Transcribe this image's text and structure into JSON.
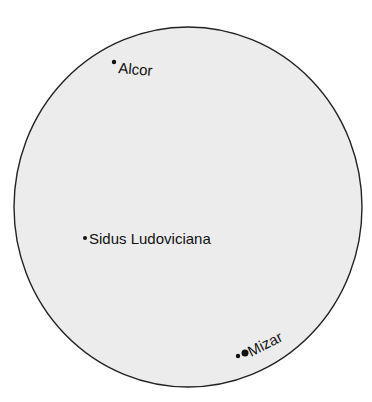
{
  "diagram": {
    "type": "telescope-field-of-view",
    "field": {
      "cx": 188,
      "cy": 207,
      "rx": 174,
      "ry": 180,
      "fill": "#ececec",
      "stroke": "#222222"
    },
    "stars": [
      {
        "name": "Alcor",
        "label": "Alcor",
        "dot": {
          "x": 114,
          "y": 62,
          "r": 2.2
        },
        "label_pos": {
          "x": 118,
          "y": 73
        },
        "rotate": 5
      },
      {
        "name": "Sidus Ludoviciana",
        "label": "Sidus Ludoviciana",
        "dot": {
          "x": 85,
          "y": 238,
          "r": 2
        },
        "label_pos": {
          "x": 89,
          "y": 244
        },
        "rotate": 0
      },
      {
        "name": "Mizar",
        "label": "Mizar",
        "dot": {
          "x": 238,
          "y": 356,
          "r": 2.2
        },
        "companion": {
          "x": 245,
          "y": 353,
          "r": 3.5
        },
        "label_pos": {
          "x": 252,
          "y": 358
        },
        "rotate": -27
      }
    ]
  }
}
